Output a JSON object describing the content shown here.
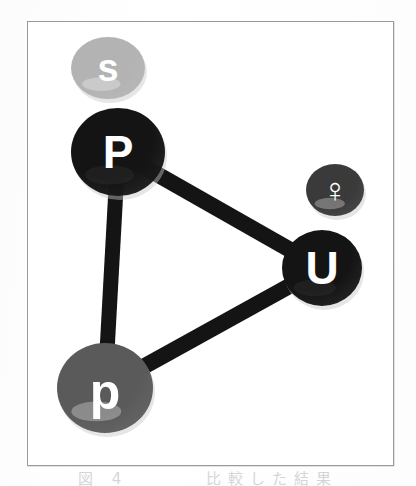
{
  "figure": {
    "type": "node-link-graph",
    "background_color": "#ffffff",
    "frame_color": "#9a9a9a",
    "caption_partial": "図 4　　　 比較した結果"
  },
  "chart_data": {
    "type": "diagram",
    "title": "",
    "nodes": [
      {
        "id": "s",
        "label": "s",
        "cx": 108,
        "cy": 68,
        "rx": 37,
        "ry": 31,
        "fill": "#b3b3b3",
        "text_color": "#ffffff",
        "font_size": 38,
        "connected": false
      },
      {
        "id": "P",
        "label": "P",
        "cx": 118,
        "cy": 152,
        "rx": 47,
        "ry": 44,
        "fill": "#141414",
        "text_color": "#ffffff",
        "font_size": 46,
        "connected": true
      },
      {
        "id": "venus",
        "label": "♀",
        "cx": 335,
        "cy": 190,
        "rx": 29,
        "ry": 26,
        "fill": "#3a3a3a",
        "text_color": "#ffffff",
        "font_size": 34,
        "connected": false
      },
      {
        "id": "U",
        "label": "U",
        "cx": 322,
        "cy": 268,
        "rx": 40,
        "ry": 38,
        "fill": "#141414",
        "text_color": "#ffffff",
        "font_size": 46,
        "connected": true
      },
      {
        "id": "p",
        "label": "p",
        "cx": 105,
        "cy": 388,
        "rx": 48,
        "ry": 45,
        "fill": "#5a5a5a",
        "text_color": "#ffffff",
        "font_size": 50,
        "connected": true
      }
    ],
    "edges": [
      {
        "id": "edge-P-U",
        "from": "P",
        "to": "U",
        "width": 16,
        "color": "#141414"
      },
      {
        "id": "edge-P-p",
        "from": "P",
        "to": "p",
        "width": 15,
        "color": "#141414"
      },
      {
        "id": "edge-p-U",
        "from": "p",
        "to": "U",
        "width": 16,
        "color": "#141414"
      }
    ],
    "legend": [],
    "xlabel": "",
    "ylabel": ""
  }
}
